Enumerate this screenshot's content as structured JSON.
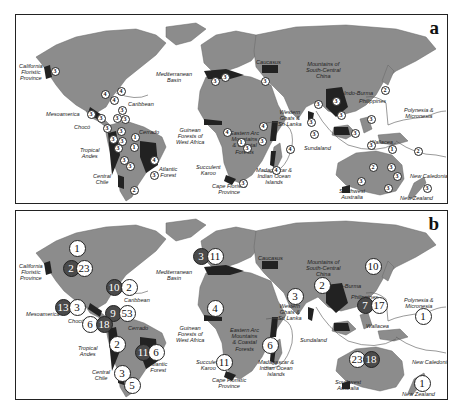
{
  "figure": {
    "panels": [
      {
        "letter": "a",
        "labels": {
          "california": "California\nFloristic\nProvince",
          "mediterranean": "Mediterranean\nBasin",
          "caucasus": "Caucasus",
          "mountains_sc_china": "Mountains of\nSouth-Central\nChina",
          "indo_burma": "Indo-Burma",
          "philippines": "Philippines",
          "polynesia": "Polynesia &\nMicronesia",
          "caribbean": "Caribbean",
          "mesoamerica": "Mesoamerica",
          "choco": "Chocó",
          "cerrado": "Cerrado",
          "tropical_andes": "Tropical\nAndes",
          "atlantic_forest": "Atlantic\nForest",
          "central_chile": "Central\nChile",
          "guinean": "Guinean\nForests of\nWest Africa",
          "eastern_arc": "Eastern Arc\nMountains\n& Coastal\nForests",
          "succulent_karoo": "Succulent\nKaroo",
          "cape_floristic": "Cape Floristic\nProvince",
          "madagascar": "Madagascar &\nIndian Ocean\nIslands",
          "western_ghats": "Western\nGhats &\nSri Lanka",
          "sundaland": "Sundaland",
          "wallacea": "Wallacea",
          "new_caledonia": "New Caledonia",
          "sw_australia": "Southwest\nAustralia",
          "new_zealand": "New Zealand"
        },
        "markers": [
          {
            "v": "3",
            "x": 39,
            "y": 56
          },
          {
            "v": "4",
            "x": 89,
            "y": 79
          },
          {
            "v": "4",
            "x": 105,
            "y": 76
          },
          {
            "v": "4",
            "x": 98,
            "y": 85
          },
          {
            "v": "3",
            "x": 75,
            "y": 99
          },
          {
            "v": "3",
            "x": 85,
            "y": 103
          },
          {
            "v": "3",
            "x": 106,
            "y": 95
          },
          {
            "v": "3",
            "x": 101,
            "y": 103
          },
          {
            "v": "3",
            "x": 109,
            "y": 104
          },
          {
            "v": "3",
            "x": 91,
            "y": 113
          },
          {
            "v": "3",
            "x": 105,
            "y": 116
          },
          {
            "v": "3",
            "x": 97,
            "y": 124
          },
          {
            "v": "3",
            "x": 106,
            "y": 126
          },
          {
            "v": "3",
            "x": 102,
            "y": 133
          },
          {
            "v": "1",
            "x": 119,
            "y": 122
          },
          {
            "v": "1",
            "x": 118,
            "y": 132
          },
          {
            "v": "3",
            "x": 108,
            "y": 145
          },
          {
            "v": "3",
            "x": 114,
            "y": 151
          },
          {
            "v": "4",
            "x": 138,
            "y": 145
          },
          {
            "v": "3",
            "x": 138,
            "y": 160
          },
          {
            "v": "2",
            "x": 118,
            "y": 175
          },
          {
            "v": "3",
            "x": 199,
            "y": 66
          },
          {
            "v": "3",
            "x": 209,
            "y": 62
          },
          {
            "v": "4",
            "x": 211,
            "y": 117
          },
          {
            "v": "1",
            "x": 225,
            "y": 127
          },
          {
            "v": "3",
            "x": 231,
            "y": 133
          },
          {
            "v": "4",
            "x": 247,
            "y": 111
          },
          {
            "v": "3",
            "x": 246,
            "y": 126
          },
          {
            "v": "3",
            "x": 227,
            "y": 168
          },
          {
            "v": "4",
            "x": 274,
            "y": 134
          },
          {
            "v": "4",
            "x": 260,
            "y": 155
          },
          {
            "v": "3",
            "x": 249,
            "y": 66
          },
          {
            "v": "3",
            "x": 295,
            "y": 107
          },
          {
            "v": "3",
            "x": 298,
            "y": 119
          },
          {
            "v": "3",
            "x": 302,
            "y": 89
          },
          {
            "v": "3",
            "x": 320,
            "y": 86
          },
          {
            "v": "3",
            "x": 325,
            "y": 100
          },
          {
            "v": "3",
            "x": 339,
            "y": 118
          },
          {
            "v": "3",
            "x": 355,
            "y": 104
          },
          {
            "v": "3",
            "x": 355,
            "y": 130
          },
          {
            "v": "1",
            "x": 376,
            "y": 134
          },
          {
            "v": "2",
            "x": 402,
            "y": 136
          },
          {
            "v": "2",
            "x": 369,
            "y": 75
          },
          {
            "v": "2",
            "x": 357,
            "y": 152
          },
          {
            "v": "3",
            "x": 375,
            "y": 152
          },
          {
            "v": "3",
            "x": 381,
            "y": 161
          },
          {
            "v": "3",
            "x": 372,
            "y": 173
          },
          {
            "v": "3",
            "x": 345,
            "y": 166
          },
          {
            "v": "3",
            "x": 411,
            "y": 173
          }
        ]
      },
      {
        "letter": "b",
        "labels": {
          "california": "California\nFloristic\nProvince",
          "mediterranean": "Mediterranean\nBasin",
          "caucasus": "Caucasus",
          "mountains_sc_china": "Mountains of\nSouth-Central\nChina",
          "indo_burma": "Indo-Burma",
          "philippines": "Philippines",
          "polynesia": "Polynesia &\nMicronesia",
          "caribbean": "Caribbean",
          "mesoamerica": "Mesoamerica",
          "choco": "Chocó",
          "cerrado": "Cerrado",
          "tropical_andes": "Tropical\nAndes",
          "atlantic_forest": "Atlantic\nForest",
          "central_chile": "Central\nChile",
          "guinean": "Guinean\nForests of\nWest Africa",
          "eastern_arc": "Eastern Arc\nMountains\n& Coastal\nForests",
          "succulent_karoo": "Succulent\nKaroo",
          "cape_floristic": "Cape Floristic\nProvince",
          "madagascar": "Madagascar &\nIndian Ocean\nIslands",
          "western_ghats": "Western\nGhats &\nSri Lanka",
          "sundaland": "Sundaland",
          "wallacea": "Wallacea",
          "new_caledonia": "New Caledonia",
          "sw_australia": "Southwest\nAustralia",
          "new_zealand": "New Zealand"
        },
        "markers": [
          {
            "v": "1",
            "x": 61,
            "y": 37,
            "dark": false
          },
          {
            "v": "2",
            "x": 55,
            "y": 57,
            "dark": true
          },
          {
            "v": "23",
            "x": 68,
            "y": 57,
            "dark": false
          },
          {
            "v": "10",
            "x": 98,
            "y": 76,
            "dark": true
          },
          {
            "v": "2",
            "x": 113,
            "y": 76,
            "dark": false
          },
          {
            "v": "13",
            "x": 47,
            "y": 96,
            "dark": true
          },
          {
            "v": "3",
            "x": 61,
            "y": 96,
            "dark": false
          },
          {
            "v": "9",
            "x": 97,
            "y": 102,
            "dark": true
          },
          {
            "v": "53",
            "x": 111,
            "y": 102,
            "dark": false
          },
          {
            "v": "6",
            "x": 74,
            "y": 113,
            "dark": false
          },
          {
            "v": "18",
            "x": 88,
            "y": 113,
            "dark": true
          },
          {
            "v": "2",
            "x": 101,
            "y": 133,
            "dark": false
          },
          {
            "v": "11",
            "x": 127,
            "y": 141,
            "dark": true
          },
          {
            "v": "6",
            "x": 140,
            "y": 141,
            "dark": false
          },
          {
            "v": "3",
            "x": 106,
            "y": 162,
            "dark": false
          },
          {
            "v": "5",
            "x": 116,
            "y": 174,
            "dark": false
          },
          {
            "v": "3",
            "x": 185,
            "y": 45,
            "dark": true
          },
          {
            "v": "11",
            "x": 199,
            "y": 45,
            "dark": false
          },
          {
            "v": "4",
            "x": 199,
            "y": 97,
            "dark": false
          },
          {
            "v": "11",
            "x": 208,
            "y": 151,
            "dark": false
          },
          {
            "v": "6",
            "x": 254,
            "y": 134,
            "dark": false
          },
          {
            "v": "3",
            "x": 279,
            "y": 85,
            "dark": false
          },
          {
            "v": "2",
            "x": 306,
            "y": 74,
            "dark": false
          },
          {
            "v": "10",
            "x": 357,
            "y": 55,
            "dark": false
          },
          {
            "v": "7",
            "x": 349,
            "y": 94,
            "dark": true
          },
          {
            "v": "17",
            "x": 363,
            "y": 94,
            "dark": false
          },
          {
            "v": "1",
            "x": 407,
            "y": 105,
            "dark": false
          },
          {
            "v": "23",
            "x": 341,
            "y": 148,
            "dark": false
          },
          {
            "v": "18",
            "x": 355,
            "y": 148,
            "dark": true
          },
          {
            "v": "1",
            "x": 406,
            "y": 172,
            "dark": false
          }
        ]
      }
    ]
  }
}
